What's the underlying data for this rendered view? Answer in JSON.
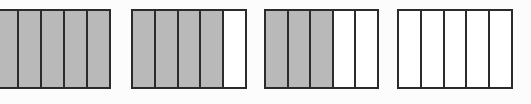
{
  "figure": {
    "background_color": "#fcfcfc",
    "shaded_color": "#b9b9b9",
    "unshaded_color": "#ffffff",
    "border_color": "#2b2b2b"
  },
  "diagram_data": {
    "type": "fraction-bar-model",
    "partitions_per_bar": 5,
    "bars": [
      {
        "index": 1,
        "label": "bar-1",
        "total_parts": 5,
        "shaded_parts": 5,
        "fraction": "5/5",
        "cells": [
          "shaded",
          "shaded",
          "shaded",
          "shaded",
          "shaded"
        ]
      },
      {
        "index": 2,
        "label": "bar-2",
        "total_parts": 5,
        "shaded_parts": 4,
        "fraction": "4/5",
        "cells": [
          "shaded",
          "shaded",
          "shaded",
          "shaded",
          "unshaded"
        ]
      },
      {
        "index": 3,
        "label": "bar-3",
        "total_parts": 5,
        "shaded_parts": 3,
        "fraction": "3/5",
        "cells": [
          "shaded",
          "shaded",
          "shaded",
          "unshaded",
          "unshaded"
        ]
      },
      {
        "index": 4,
        "label": "bar-4",
        "total_parts": 5,
        "shaded_parts": 0,
        "fraction": "0/5",
        "cells": [
          "unshaded",
          "unshaded",
          "unshaded",
          "unshaded",
          "unshaded"
        ]
      }
    ]
  }
}
